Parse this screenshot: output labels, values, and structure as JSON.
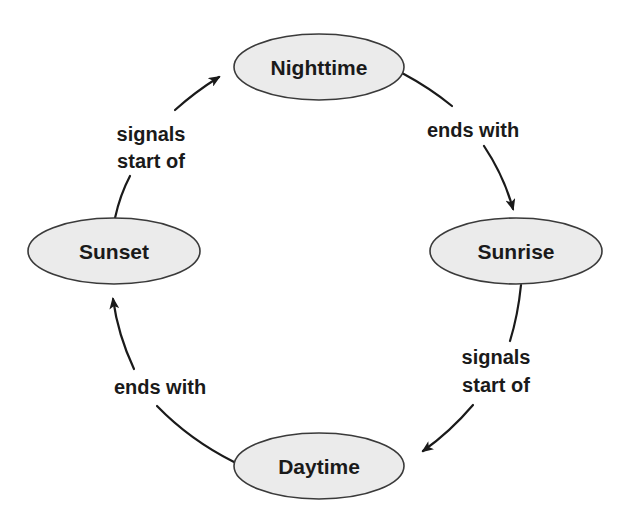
{
  "colors": {
    "node_fill": "#ebebeb",
    "node_stroke": "#3a3a3a",
    "text": "#1a1a1a",
    "background": "#ffffff"
  },
  "nodes": [
    {
      "id": "nighttime",
      "label": "Nighttime"
    },
    {
      "id": "sunrise",
      "label": "Sunrise"
    },
    {
      "id": "daytime",
      "label": "Daytime"
    },
    {
      "id": "sunset",
      "label": "Sunset"
    }
  ],
  "edges": [
    {
      "from": "nighttime",
      "to": "sunrise",
      "label_lines": [
        "ends with"
      ]
    },
    {
      "from": "sunrise",
      "to": "daytime",
      "label_lines": [
        "signals",
        "start of"
      ]
    },
    {
      "from": "daytime",
      "to": "sunset",
      "label_lines": [
        "ends with"
      ]
    },
    {
      "from": "sunset",
      "to": "nighttime",
      "label_lines": [
        "signals",
        "start of"
      ]
    }
  ]
}
